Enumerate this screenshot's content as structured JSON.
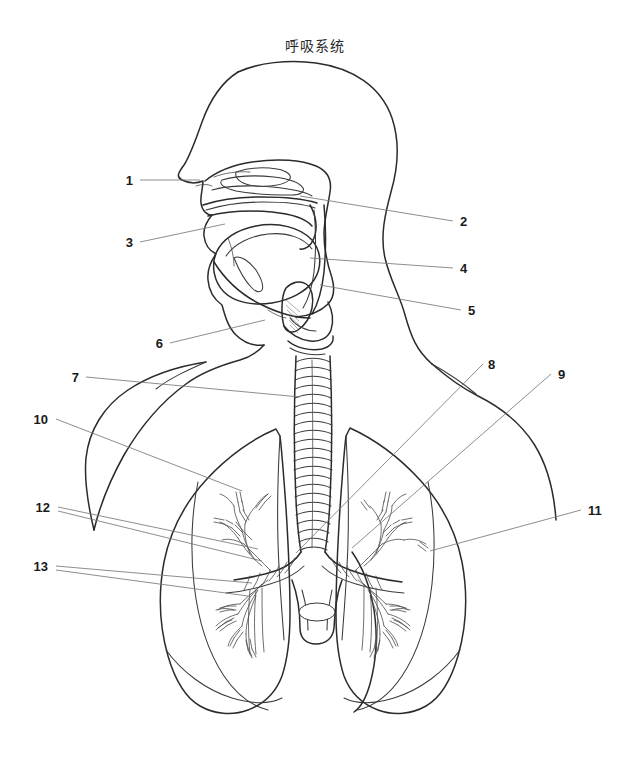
{
  "figure": {
    "title": "呼吸系统",
    "title_position": {
      "x": 315,
      "y": 51
    },
    "background_color": "#ffffff",
    "stroke_color": "#2b2b2b",
    "leader_color": "#787878",
    "width": 630,
    "height": 770
  },
  "labels": [
    {
      "id": "1",
      "text": "1",
      "x": 133,
      "y": 185,
      "anchor": "end",
      "side": "left"
    },
    {
      "id": "2",
      "text": "2",
      "x": 460,
      "y": 226,
      "anchor": "start",
      "side": "right"
    },
    {
      "id": "3",
      "text": "3",
      "x": 133,
      "y": 247,
      "anchor": "end",
      "side": "left"
    },
    {
      "id": "4",
      "text": "4",
      "x": 460,
      "y": 273,
      "anchor": "start",
      "side": "right"
    },
    {
      "id": "5",
      "text": "5",
      "x": 468,
      "y": 315,
      "anchor": "start",
      "side": "right"
    },
    {
      "id": "6",
      "text": "6",
      "x": 163,
      "y": 348,
      "anchor": "end",
      "side": "left"
    },
    {
      "id": "7",
      "text": "7",
      "x": 79,
      "y": 382,
      "anchor": "end",
      "side": "left"
    },
    {
      "id": "8",
      "text": "8",
      "x": 488,
      "y": 369,
      "anchor": "start",
      "side": "right"
    },
    {
      "id": "9",
      "text": "9",
      "x": 558,
      "y": 379,
      "anchor": "start",
      "side": "right"
    },
    {
      "id": "10",
      "text": "10",
      "x": 48,
      "y": 424,
      "anchor": "end",
      "side": "left"
    },
    {
      "id": "11",
      "text": "11",
      "x": 588,
      "y": 515,
      "anchor": "start",
      "side": "right"
    },
    {
      "id": "12",
      "text": "12",
      "x": 50,
      "y": 512,
      "anchor": "end",
      "side": "left"
    },
    {
      "id": "13",
      "text": "13",
      "x": 48,
      "y": 571,
      "anchor": "end",
      "side": "left"
    }
  ],
  "leaders": [
    {
      "for": "1",
      "points": "140,180 200,180"
    },
    {
      "for": "2",
      "points": "453,221 300,196"
    },
    {
      "for": "3",
      "points": "140,242 225,224"
    },
    {
      "for": "4",
      "points": "453,268 310,258"
    },
    {
      "for": "5",
      "points": "461,310 320,285"
    },
    {
      "for": "6",
      "points": "170,343 265,320"
    },
    {
      "for": "7",
      "points": "86,377 300,397"
    },
    {
      "for": "8",
      "points": "483,364 296,553"
    },
    {
      "for": "9",
      "points": "551,374 352,548"
    },
    {
      "for": "10",
      "points": "56,419 242,491"
    },
    {
      "for": "11",
      "points": "581,510 430,551"
    },
    {
      "for": "12",
      "points": "58,507 258,549"
    },
    {
      "for": "12b",
      "points": "58,511 262,561"
    },
    {
      "for": "13",
      "points": "56,566 252,583"
    },
    {
      "for": "13b",
      "points": "56,570 248,596"
    }
  ],
  "parts": {
    "title_note": "Sagittal head section with nasal cavity, oral cavity, pharynx, larynx, trachea, bronchi and both lungs",
    "names": [
      "head-profile-outline",
      "neck-and-shoulder-outline",
      "nasal-cavity",
      "nasal-turbinates",
      "hard-palate",
      "oral-cavity",
      "tongue",
      "soft-palate",
      "pharynx",
      "epiglottis",
      "larynx",
      "trachea",
      "carina",
      "left-main-bronchus",
      "right-main-bronchus",
      "bronchial-tree-left",
      "bronchial-tree-right",
      "left-lung",
      "right-lung",
      "oblique-fissure",
      "pulmonary-vessel"
    ]
  }
}
